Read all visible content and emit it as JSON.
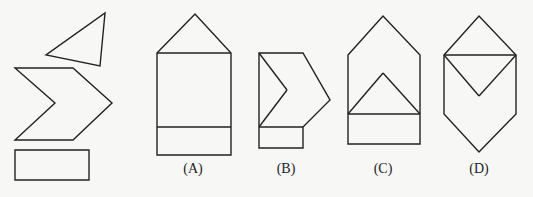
{
  "pieces": {
    "triangle": {
      "name": "triangle-piece",
      "points": "105,13 100,66 46,55"
    },
    "chevron": {
      "name": "chevron-piece",
      "points": "15,68 73,68 112,103 73,140 15,140 55,103"
    },
    "rectangle": {
      "name": "rectangle-piece",
      "points": "15,150 89,150 89,180 15,180"
    }
  },
  "options": [
    {
      "label": "(A)",
      "label_x": 193,
      "outline": "157,53 195,14 231,53 231,155 157,155",
      "lines": [
        {
          "x1": 157,
          "y1": 53,
          "x2": 231,
          "y2": 53
        },
        {
          "x1": 157,
          "y1": 127,
          "x2": 231,
          "y2": 127
        }
      ]
    },
    {
      "label": "(B)",
      "label_x": 286,
      "outline": "259,53 303,53 330,100 303,127 303,148 259,148",
      "lines": [
        {
          "x1": 259,
          "y1": 53,
          "x2": 287,
          "y2": 90
        },
        {
          "x1": 287,
          "y1": 90,
          "x2": 259,
          "y2": 127
        },
        {
          "x1": 259,
          "y1": 127,
          "x2": 303,
          "y2": 127
        }
      ]
    },
    {
      "label": "(C)",
      "label_x": 383,
      "outline": "348,55 383,16 420,55 420,144 348,144",
      "lines": [
        {
          "x1": 348,
          "y1": 114,
          "x2": 420,
          "y2": 114
        },
        {
          "x1": 348,
          "y1": 114,
          "x2": 383,
          "y2": 73
        },
        {
          "x1": 383,
          "y1": 73,
          "x2": 420,
          "y2": 114
        }
      ]
    },
    {
      "label": "(D)",
      "label_x": 479,
      "outline": "444,55 479,16 516,55 516,114 479,152 444,114",
      "lines": [
        {
          "x1": 444,
          "y1": 55,
          "x2": 516,
          "y2": 55
        },
        {
          "x1": 444,
          "y1": 55,
          "x2": 479,
          "y2": 96
        },
        {
          "x1": 479,
          "y1": 96,
          "x2": 516,
          "y2": 55
        }
      ]
    }
  ]
}
